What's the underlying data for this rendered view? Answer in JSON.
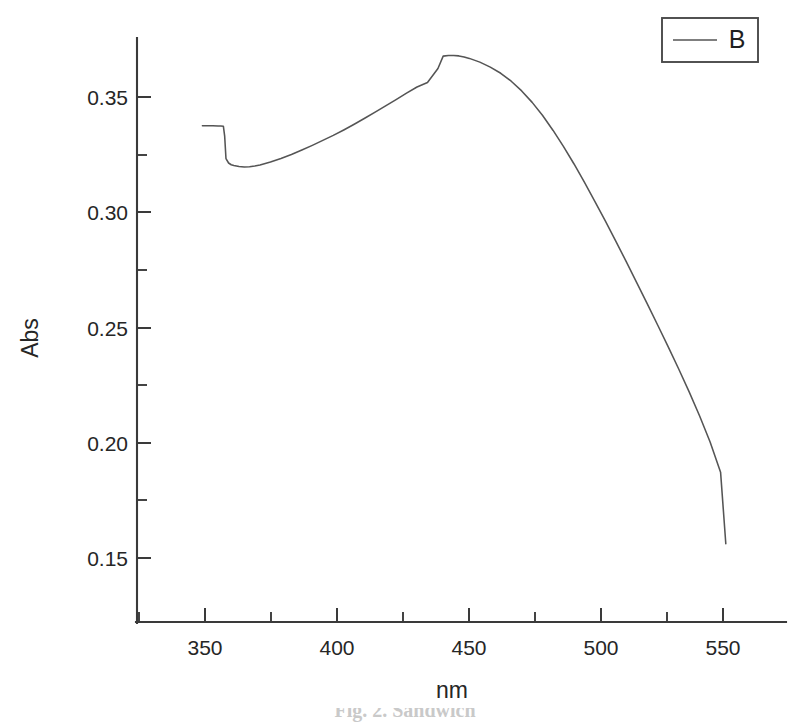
{
  "figure": {
    "background_color": "#ffffff",
    "line_color": "#555555",
    "axis_color": "#3a3a3a",
    "text_color": "#262626",
    "caption_partial": "Fig. 2. Sandwich"
  },
  "legend": {
    "position": "top-right",
    "entries": [
      {
        "label": "B",
        "color": "#555555",
        "marker": "line"
      }
    ]
  },
  "axes": {
    "x": {
      "title": "nm",
      "ticks": [
        "350",
        "400",
        "450",
        "500",
        "550"
      ],
      "range": [
        325,
        573
      ],
      "minor_ticks_per_interval": 1
    },
    "y": {
      "title": "Abs",
      "ticks": [
        "0.35",
        "0.30",
        "0.25",
        "0.20",
        "0.15"
      ],
      "range": [
        0.1225,
        0.3575
      ],
      "minor_ticks_per_interval": 1
    }
  },
  "chart_data": {
    "type": "line",
    "title": "",
    "subtitle": "",
    "xlabel": "nm",
    "ylabel": "Abs",
    "xlim": [
      325,
      573
    ],
    "ylim": [
      0.1225,
      0.3575
    ],
    "xticks": [
      350,
      400,
      450,
      500,
      550
    ],
    "yticks": [
      0.15,
      0.2,
      0.25,
      0.3,
      0.35
    ],
    "grid": false,
    "legend_position": "top-right",
    "series": [
      {
        "name": "B",
        "color": "#555555",
        "x": [
          350,
          352,
          354,
          356,
          357,
          358,
          358.5,
          359,
          360,
          361,
          362,
          364,
          366,
          368,
          370,
          372,
          374,
          376,
          378,
          380,
          384,
          388,
          392,
          396,
          400,
          404,
          408,
          412,
          416,
          420,
          424,
          428,
          432,
          436,
          440,
          442,
          444,
          446,
          448,
          450,
          452,
          456,
          460,
          464,
          468,
          472,
          476,
          480,
          484,
          488,
          492,
          496,
          500,
          504,
          508,
          512,
          516,
          520,
          524,
          528,
          532,
          536,
          540,
          544,
          548,
          550
        ],
        "y": [
          0.3222,
          0.3222,
          0.3222,
          0.3221,
          0.3221,
          0.322,
          0.318,
          0.309,
          0.3072,
          0.3065,
          0.3062,
          0.3058,
          0.3056,
          0.3057,
          0.306,
          0.3064,
          0.307,
          0.3076,
          0.3083,
          0.309,
          0.3106,
          0.3124,
          0.3143,
          0.3163,
          0.3183,
          0.3205,
          0.3228,
          0.3252,
          0.3277,
          0.3302,
          0.3327,
          0.3353,
          0.3378,
          0.3396,
          0.3452,
          0.3502,
          0.3505,
          0.3505,
          0.3503,
          0.3499,
          0.3493,
          0.3478,
          0.3458,
          0.3433,
          0.3401,
          0.3362,
          0.3316,
          0.3263,
          0.3203,
          0.3138,
          0.3068,
          0.2994,
          0.2917,
          0.2838,
          0.2757,
          0.2674,
          0.259,
          0.2505,
          0.2419,
          0.2332,
          0.2243,
          0.2151,
          0.2054,
          0.1949,
          0.1828,
          0.154
        ]
      }
    ]
  }
}
